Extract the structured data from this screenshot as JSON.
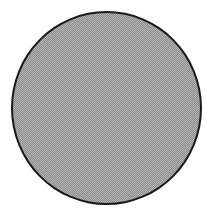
{
  "shape": {
    "type": "circle",
    "fill": "dithered-gray",
    "fill_color": "#a0a0a0",
    "stroke_color": "#1a1a1a",
    "center": [
      106,
      108
    ],
    "radius": 95
  }
}
